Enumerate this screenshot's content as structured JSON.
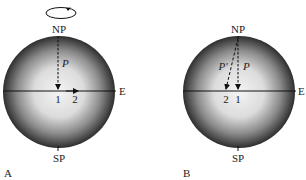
{
  "panels": [
    {
      "id": "A",
      "panel_label": "A",
      "north_label": "NP",
      "south_label": "SP",
      "east_label": "E",
      "vector_label": "P",
      "point_1": "1",
      "point_2": "2",
      "rotation_icon": "rotation-arrow-icon"
    },
    {
      "id": "B",
      "panel_label": "B",
      "north_label": "NP",
      "south_label": "SP",
      "east_label": "E",
      "vector_label": "P",
      "vector_label_prime": "P'",
      "point_1": "1",
      "point_2": "2"
    }
  ],
  "colors": {
    "sphere_center": "#f2f2f2",
    "sphere_edge": "#2a2a2a",
    "line": "#111111"
  }
}
